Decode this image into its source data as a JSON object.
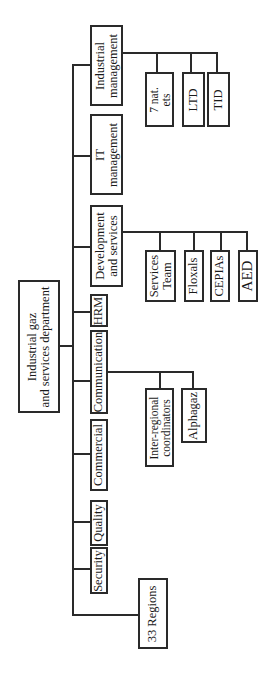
{
  "diagram": {
    "type": "org-chart",
    "orientation": "rotated-90",
    "root": {
      "label": "Industrial gaz\nand services department"
    },
    "departments": [
      {
        "id": "industrial_management",
        "label": "Industrial\nmanagement",
        "children": [
          "7 nat.\nets",
          "LTD",
          "TID"
        ]
      },
      {
        "id": "it_management",
        "label": "IT\nmanagement",
        "children": []
      },
      {
        "id": "development_services",
        "label": "Development\nand services",
        "children": [
          "Services\nTeam",
          "Floxals",
          "CEPIAs",
          "AED"
        ]
      },
      {
        "id": "hrm",
        "label": "HRM",
        "children": []
      },
      {
        "id": "communication",
        "label": "Communication",
        "children": [
          "Inter-regional\ncoordinators",
          "Alphagaz"
        ]
      },
      {
        "id": "commercial",
        "label": "Commercial",
        "children": []
      },
      {
        "id": "quality",
        "label": "Quality",
        "children": []
      },
      {
        "id": "security",
        "label": "Security",
        "children": []
      }
    ],
    "regions": {
      "label": "33 Regions"
    },
    "colors": {
      "line": "#2a2a2a",
      "box_fill": "#ffffff",
      "text": "#1a1a1a",
      "background": "#ffffff"
    }
  }
}
